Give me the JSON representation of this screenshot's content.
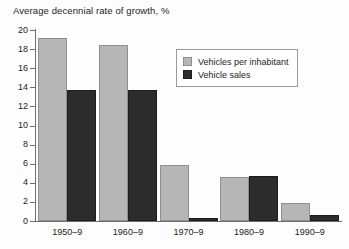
{
  "chart_data": {
    "type": "bar",
    "title": "Average decennial rate of growth, %",
    "xlabel": "",
    "ylabel": "",
    "ylim": [
      0,
      20
    ],
    "ytick_step": 2,
    "yticks": [
      0,
      2,
      4,
      6,
      8,
      10,
      12,
      14,
      16,
      18,
      20
    ],
    "grid": false,
    "legend_position": "upper-right-inside",
    "categories": [
      "1950–9",
      "1960–9",
      "1970–9",
      "1980–9",
      "1990–9"
    ],
    "series": [
      {
        "name": "Vehicles per inhabitant",
        "color": "#b6b6b6",
        "values": [
          19.2,
          18.4,
          5.9,
          4.6,
          1.9
        ]
      },
      {
        "name": "Vehicle sales",
        "color": "#2c2c2c",
        "values": [
          13.7,
          13.7,
          0.3,
          4.7,
          0.6
        ]
      }
    ]
  },
  "axis": {
    "y_tick_labels": [
      "20",
      "18",
      "16",
      "14",
      "12",
      "10",
      "8",
      "6",
      "4",
      "2",
      "0"
    ]
  }
}
